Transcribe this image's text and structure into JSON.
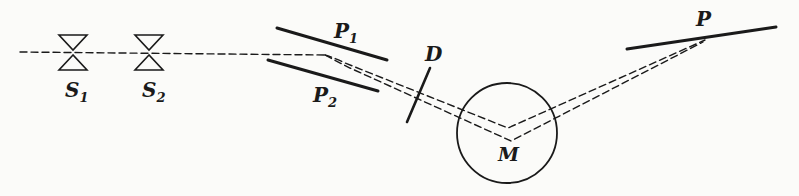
{
  "diagram": {
    "type": "apparatus-schematic",
    "colors": {
      "ink": "#1a1a1a",
      "background": "#fbfbf9"
    },
    "labels": {
      "s1": {
        "main": "S",
        "sub": "1"
      },
      "s2": {
        "main": "S",
        "sub": "2"
      },
      "p1": {
        "main": "P",
        "sub": "1"
      },
      "p2": {
        "main": "P",
        "sub": "2"
      },
      "d": {
        "main": "D"
      },
      "m": {
        "main": "M"
      },
      "p": {
        "main": "P"
      }
    },
    "components": [
      {
        "id": "S1",
        "kind": "slit"
      },
      {
        "id": "S2",
        "kind": "slit"
      },
      {
        "id": "P1",
        "kind": "deflector-plate"
      },
      {
        "id": "P2",
        "kind": "deflector-plate"
      },
      {
        "id": "D",
        "kind": "diaphragm"
      },
      {
        "id": "M",
        "kind": "circular-region"
      },
      {
        "id": "P",
        "kind": "detector-plate"
      }
    ]
  }
}
